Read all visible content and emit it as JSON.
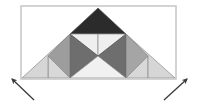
{
  "canvas": {
    "width": 198,
    "height": 105,
    "background": "#ffffff"
  },
  "frame": {
    "label": "bounding rectangle",
    "x": 21,
    "y": 6,
    "width": 155,
    "height": 73,
    "stroke": "#c9c9c9",
    "stroke_width": 1.6,
    "fill": "none"
  },
  "palette": {
    "very_dark": "#2b2b2b",
    "dark_gray": "#6e6e6e",
    "mid_gray": "#9a9a9a",
    "light_gray": "#c5c5c5",
    "pale_gray": "#e2e2e2",
    "near_white": "#f1f1f1",
    "outline": "#8a8a8a",
    "arrow": "#3a3a3a"
  },
  "figure": {
    "label": "subdivided triangle diagram",
    "apex": [
      98,
      8
    ],
    "base_left": [
      22,
      78
    ],
    "base_right": [
      175,
      78
    ],
    "pieces": [
      {
        "name": "apex-dark-triangle",
        "points": "98,8 70,34 126,34",
        "fill": "#2b2b2b",
        "stroke": "#555555"
      },
      {
        "name": "upper-left-light-triangle",
        "points": "70,34 98,34 98,56",
        "fill": "#efefef",
        "stroke": "#8a8a8a"
      },
      {
        "name": "upper-right-light-triangle",
        "points": "98,34 126,34 98,56",
        "fill": "#efefef",
        "stroke": "#8a8a8a"
      },
      {
        "name": "center-left-dark-triangle",
        "points": "70,34 98,56 70,78",
        "fill": "#6e6e6e",
        "stroke": "#555555"
      },
      {
        "name": "center-right-dark-triangle",
        "points": "126,34 126,78 98,56",
        "fill": "#6e6e6e",
        "stroke": "#555555"
      },
      {
        "name": "lower-center-light-triangle",
        "points": "70,78 98,56 126,78",
        "fill": "#f1f1f1",
        "stroke": "#8a8a8a"
      },
      {
        "name": "left-mid-gray-triangle",
        "points": "70,34 70,78 48,56",
        "fill": "#9d9d9d",
        "stroke": "#7a7a7a"
      },
      {
        "name": "left-pale-triangle",
        "points": "48,56 70,78 48,78",
        "fill": "#d8d8d8",
        "stroke": "#8a8a8a"
      },
      {
        "name": "left-outer-pale-triangle",
        "points": "70,34 48,56 48,78 22,78",
        "fill": "#d6d6d6",
        "stroke": "#8a8a8a"
      },
      {
        "name": "right-mid-gray-triangle",
        "points": "126,34 148,56 126,78",
        "fill": "#a5a5a5",
        "stroke": "#7a7a7a"
      },
      {
        "name": "right-pale-triangle",
        "points": "148,56 148,78 126,78",
        "fill": "#d8d8d8",
        "stroke": "#8a8a8a"
      },
      {
        "name": "right-outer-pale-triangle",
        "points": "126,34 175,78 148,78 148,56",
        "fill": "#d6d6d6",
        "stroke": "#8a8a8a"
      }
    ]
  },
  "arrows": [
    {
      "name": "left-arrow",
      "direction": "up-left",
      "tail": [
        34,
        100
      ],
      "head": [
        12,
        79
      ],
      "stroke": "#3a3a3a",
      "stroke_width": 1.3
    },
    {
      "name": "right-arrow",
      "direction": "up-right",
      "tail": [
        164,
        100
      ],
      "head": [
        187,
        79
      ],
      "stroke": "#3a3a3a",
      "stroke_width": 1.3
    }
  ]
}
